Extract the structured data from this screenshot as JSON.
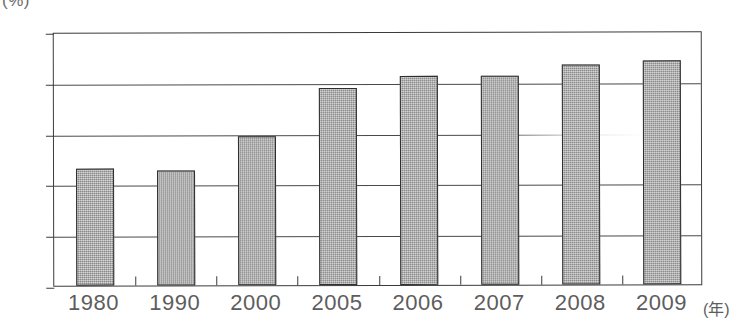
{
  "chart_data": {
    "type": "bar",
    "title": "",
    "xlabel": "(年)",
    "ylabel": "(%)",
    "categories": [
      "1980",
      "1990",
      "2000",
      "2005",
      "2006",
      "2007",
      "2008",
      "2009"
    ],
    "values": [
      23.0,
      22.7,
      29.4,
      38.8,
      41.2,
      41.2,
      43.3,
      44.0
    ],
    "ylim": [
      0,
      50
    ],
    "yticks": [
      0,
      10,
      20,
      30,
      40,
      50
    ],
    "ytick_labels": [
      "0",
      "10",
      "20",
      "30",
      "40",
      "50"
    ],
    "grid": true,
    "legend": false,
    "series": [
      {
        "name": "",
        "values": [
          23.0,
          22.7,
          29.4,
          38.8,
          41.2,
          41.2,
          43.3,
          44.0
        ]
      }
    ],
    "bar_color": "#9d9d9d",
    "bar_edge_color": "#2e2e2e",
    "axis_color": "#3b3b3b",
    "tick_label_color": "#5d5d5d"
  }
}
